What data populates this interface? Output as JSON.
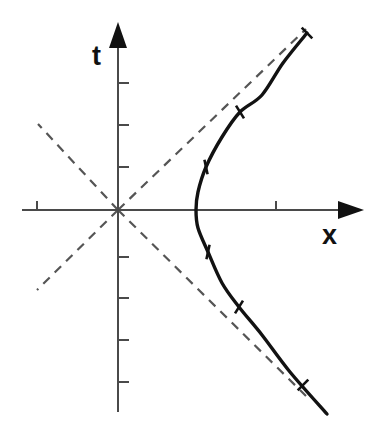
{
  "figure": {
    "kind": "minkowski-spacetime-diagram",
    "background_color": "#ffffff",
    "width": 371,
    "height": 438
  },
  "axes": {
    "vertical": {
      "label": "t",
      "label_position": {
        "x": 92,
        "y": 43
      },
      "color": "#4a4a4a",
      "line": {
        "x": 118,
        "y_top": 34,
        "y_bottom": 412
      },
      "arrow": {
        "direction": "up",
        "tip_x": 118,
        "tip_y": 22,
        "half_width": 9,
        "length": 26
      },
      "ticks_above_origin": [
        83,
        125,
        167
      ],
      "ticks_below_origin": [
        257,
        298,
        340,
        382
      ],
      "tick_length": 11,
      "tick_side": "right"
    },
    "horizontal": {
      "label": "x",
      "label_position": {
        "x": 322,
        "y": 222
      },
      "color": "#4a4a4a",
      "line": {
        "y": 210,
        "x_left": 22,
        "x_right": 352
      },
      "arrow": {
        "direction": "right",
        "tip_x": 364,
        "tip_y": 210,
        "half_height": 9,
        "length": 26
      },
      "ticks": [
        37,
        276
      ],
      "tick_length": 9,
      "tick_side": "up"
    },
    "origin": {
      "x": 118,
      "y": 210
    }
  },
  "asymptotes": {
    "name": "light-cone",
    "color": "#555555",
    "dash": "9 7",
    "slope": 1,
    "segments": [
      {
        "name": "upper-right",
        "x1": 118,
        "y1": 210,
        "x2": 306,
        "y2": 29
      },
      {
        "name": "lower-right",
        "x1": 118,
        "y1": 210,
        "x2": 306,
        "y2": 396
      },
      {
        "name": "upper-left",
        "x1": 118,
        "y1": 210,
        "x2": 38,
        "y2": 124
      },
      {
        "name": "lower-left",
        "x1": 118,
        "y1": 210,
        "x2": 37,
        "y2": 290
      }
    ]
  },
  "chart_data": {
    "type": "line",
    "title": "",
    "xlabel": "x",
    "ylabel": "t",
    "grid": false,
    "legend": null,
    "curves": [
      {
        "name": "invariant-hyperbola",
        "equation": "x^2 - t^2 = a^2",
        "color": "#121212",
        "vertex": {
          "x": 196,
          "y": 210
        },
        "semi_axis_px": 78,
        "opens": "right",
        "points": [
          {
            "x": 307,
            "y": 33
          },
          {
            "x": 283,
            "y": 63
          },
          {
            "x": 262,
            "y": 95
          },
          {
            "x": 240,
            "y": 112
          },
          {
            "x": 222,
            "y": 137
          },
          {
            "x": 206,
            "y": 167
          },
          {
            "x": 198,
            "y": 192
          },
          {
            "x": 196,
            "y": 210
          },
          {
            "x": 198,
            "y": 228
          },
          {
            "x": 208,
            "y": 252
          },
          {
            "x": 222,
            "y": 283
          },
          {
            "x": 239,
            "y": 307
          },
          {
            "x": 262,
            "y": 335
          },
          {
            "x": 290,
            "y": 372
          },
          {
            "x": 327,
            "y": 414
          }
        ]
      }
    ],
    "curve_markers": {
      "style": "cross-tick",
      "length": 15,
      "positions": [
        {
          "x": 307,
          "y": 33,
          "angle_deg": 45
        },
        {
          "x": 240,
          "y": 112,
          "angle_deg": 58
        },
        {
          "x": 206,
          "y": 167,
          "angle_deg": 78
        },
        {
          "x": 208,
          "y": 252,
          "angle_deg": 102
        },
        {
          "x": 239,
          "y": 307,
          "angle_deg": 122
        },
        {
          "x": 303,
          "y": 385,
          "angle_deg": 135
        }
      ]
    },
    "axis_ranges": {
      "x_px": [
        22,
        364
      ],
      "t_px": [
        22,
        412
      ]
    }
  }
}
